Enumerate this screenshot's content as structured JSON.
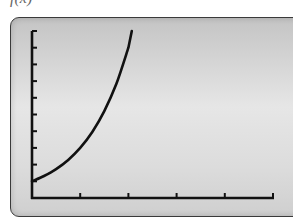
{
  "header": {
    "title_fragment": "f(x) = "
  },
  "chart_data": {
    "type": "line",
    "title": "",
    "xlabel": "",
    "ylabel": "",
    "x": [
      0,
      0.25,
      0.5,
      0.75,
      1,
      1.25,
      1.5,
      1.75,
      2
    ],
    "series": [
      {
        "name": "f(x)",
        "values": [
          1,
          1.32,
          1.73,
          2.28,
          3,
          3.95,
          5.2,
          6.84,
          9
        ]
      }
    ],
    "xlim": [
      0,
      5
    ],
    "ylim": [
      0,
      10
    ],
    "x_ticks": [
      1,
      2,
      3,
      4,
      5
    ],
    "y_ticks": [
      1,
      2,
      3,
      4,
      5,
      6,
      7,
      8,
      9,
      10
    ],
    "tick_labels_shown": false,
    "grid": false,
    "legend": "none",
    "colors": {
      "curve": "#111111",
      "axes": "#111111",
      "screen_background": "#dcdcdc",
      "screen_border": "#3a3a3a"
    }
  }
}
